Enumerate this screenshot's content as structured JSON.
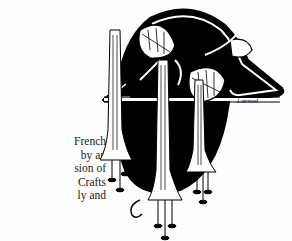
{
  "page": {
    "body_text_lines": [
      "French",
      "by an",
      "sion of",
      "Crafts",
      "ly and"
    ]
  },
  "illustration": {
    "description": "Art Nouveau black-and-white ink drawing of hanging trumpet-shaped flowers with leaves inside an arched frame",
    "signature": "Lœnod"
  },
  "colors": {
    "ink": "#000000",
    "paper": "#ffffff"
  }
}
